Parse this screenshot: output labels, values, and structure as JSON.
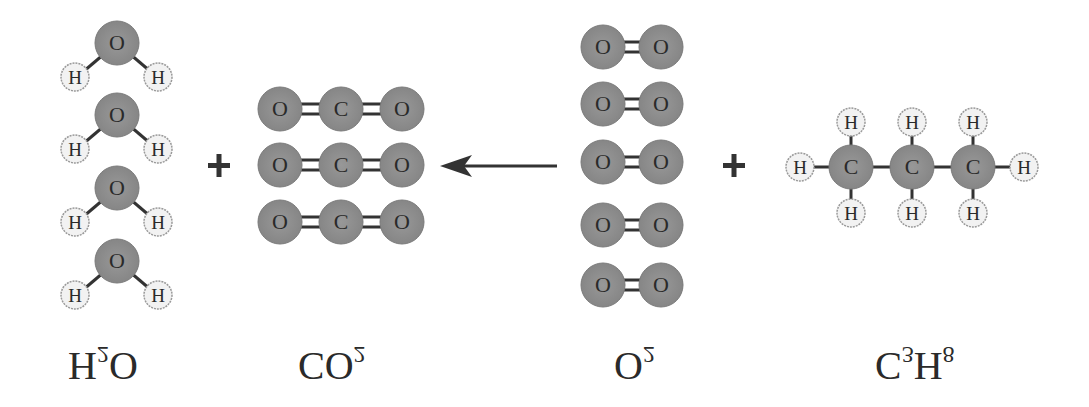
{
  "diagram": {
    "orientation": "vertically-flipped",
    "equation_direction": "right-to-left",
    "colors": {
      "background": "#ffffff",
      "heavy_atom_fill": "#8f8f8f",
      "heavy_atom_stroke": "#7a7a7a",
      "hydrogen_fill": "#f2f2f2",
      "hydrogen_stroke": "#9a9a9a",
      "bond": "#333333",
      "text": "#2a2a2a"
    },
    "groups": [
      {
        "id": "water",
        "formula": "H",
        "sub": "2",
        "tail": "O",
        "count": 4,
        "molecule": "H2O"
      },
      {
        "id": "carbon-dioxide",
        "formula": "CO",
        "sub": "2",
        "tail": "",
        "count": 3,
        "molecule": "CO2"
      },
      {
        "id": "oxygen",
        "formula": "O",
        "sub": "2",
        "tail": "",
        "count": 5,
        "molecule": "O2"
      },
      {
        "id": "propane",
        "formula": "C",
        "sub": "3",
        "tail": "H",
        "sub2": "8",
        "count": 1,
        "molecule": "C3H8"
      }
    ],
    "operators": {
      "plus_left": "+",
      "plus_right": "+",
      "arrow": "reaction-arrow-left"
    },
    "atom_symbols": {
      "oxygen": "O",
      "carbon": "C",
      "hydrogen": "H"
    }
  }
}
